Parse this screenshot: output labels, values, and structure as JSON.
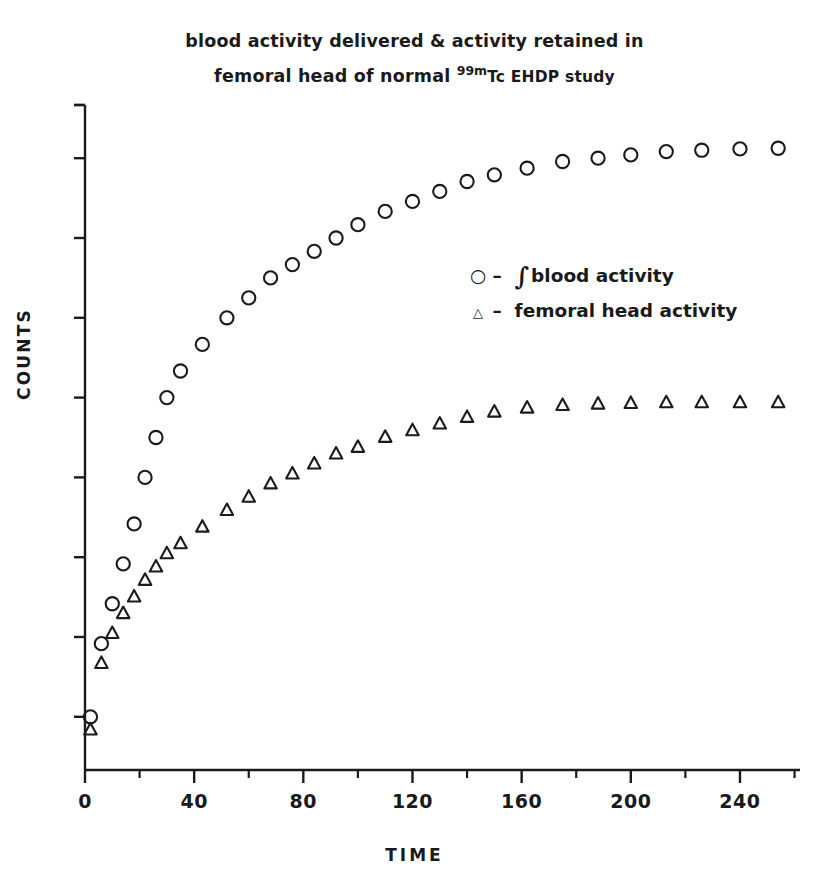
{
  "chart_data": {
    "type": "scatter",
    "title_line1": "blood activity delivered & activity retained in",
    "title_line2_pre": "femoral head of normal ",
    "title_sup": "99m",
    "title_line2_post": "Tc EHDP study",
    "xlabel": "TIME",
    "ylabel": "COUNTS",
    "xlim": [
      0,
      262
    ],
    "ylim": [
      0,
      100
    ],
    "xticks": [
      0,
      40,
      80,
      120,
      160,
      200,
      240
    ],
    "xtick_labels": [
      "0",
      "40",
      "80",
      "120",
      "160",
      "200",
      "240"
    ],
    "x_minor_ticks": [
      20,
      60,
      100,
      140,
      180,
      220,
      260
    ],
    "ytick_values": [
      8,
      20,
      32,
      44,
      56,
      68,
      80,
      92,
      100
    ],
    "ytick_labels": [],
    "grid": false,
    "legend_position": "center-right",
    "series": [
      {
        "name": "∫ blood activity",
        "marker": "circle",
        "legend_symbol": "○",
        "x": [
          2,
          6,
          10,
          14,
          18,
          22,
          26,
          30,
          35,
          43,
          52,
          60,
          68,
          76,
          84,
          92,
          100,
          110,
          120,
          130,
          140,
          150,
          162,
          175,
          188,
          200,
          213,
          226,
          240,
          254
        ],
        "y": [
          8,
          19,
          25,
          31,
          37,
          44,
          50,
          56,
          60,
          64,
          68,
          71,
          74,
          76,
          78,
          80,
          82,
          84,
          85.5,
          87,
          88.5,
          89.5,
          90.5,
          91.5,
          92,
          92.5,
          93,
          93.2,
          93.4,
          93.5
        ]
      },
      {
        "name": "femoral head activity",
        "marker": "triangle",
        "legend_symbol": "△",
        "x": [
          2,
          6,
          10,
          14,
          18,
          22,
          26,
          30,
          35,
          43,
          52,
          60,
          68,
          76,
          84,
          92,
          100,
          110,
          120,
          130,
          140,
          150,
          162,
          175,
          188,
          200,
          213,
          226,
          240,
          254
        ],
        "y": [
          6,
          16,
          20.5,
          23.5,
          26,
          28.5,
          30.5,
          32.5,
          34,
          36.5,
          39,
          41,
          43,
          44.5,
          46,
          47.5,
          48.5,
          50,
          51,
          52,
          53,
          53.8,
          54.4,
          54.8,
          55,
          55.1,
          55.2,
          55.2,
          55.2,
          55.2
        ]
      }
    ]
  },
  "style": {
    "ink": "#1a1a1a",
    "background": "#ffffff"
  }
}
